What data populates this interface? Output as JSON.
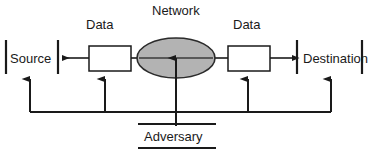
{
  "diagram": {
    "nodes": {
      "source": "Source",
      "destination": "Destination",
      "network": "Network",
      "adversary": "Adversary",
      "data_left": "Data",
      "data_right": "Data"
    },
    "colors": {
      "stroke": "#1a1a1a",
      "ellipse_fill": "#b3b3b3",
      "box_fill": "#ffffff",
      "background": "#ffffff",
      "text": "#1a1a1a"
    },
    "shapes": {
      "ellipse": {
        "cx": 176,
        "cy": 58,
        "rx": 39,
        "ry": 20
      },
      "data_box_left": {
        "x": 89,
        "y": 46,
        "width": 42,
        "height": 25
      },
      "data_box_right": {
        "x": 228,
        "y": 46,
        "width": 42,
        "height": 25
      },
      "source_bar_left": {
        "x": 6,
        "y": 40,
        "height": 34
      },
      "source_bar_right": {
        "x": 58,
        "y": 40,
        "height": 34
      },
      "dest_bar_left": {
        "x": 297,
        "y": 40,
        "height": 34
      },
      "dest_bar_right": {
        "x": 362,
        "y": 40,
        "height": 34
      },
      "adversary_rule_top": {
        "x1": 138,
        "x2": 216,
        "y": 124
      },
      "adversary_rule_bottom": {
        "x1": 138,
        "x2": 216,
        "y": 148
      },
      "bus_line": {
        "x1": 30,
        "x2": 331,
        "y": 112
      },
      "tap_arrow_x": [
        30,
        105,
        248,
        331
      ],
      "tap_arrow_top_y": 79,
      "center_arrow_x": 176,
      "center_arrow_top_y": 58
    }
  }
}
